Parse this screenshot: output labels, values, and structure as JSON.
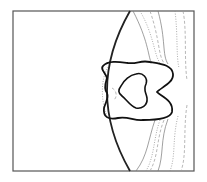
{
  "figure": {
    "type": "contour-plot",
    "frame": {
      "x": 13,
      "y": 11,
      "width": 181,
      "height": 160,
      "stroke": "#555555"
    },
    "colors": {
      "frame": "#555555",
      "shock": "#222222",
      "body_outer": "#111111",
      "body_inner": "#111111",
      "thin_contour": "#777777",
      "dotted_contour": "#888888",
      "dashed_contour": "#999999"
    },
    "shock_front": "M 130 11 Q 84 91 130 171",
    "body_outer": "M 103 66 C 108 60 120 62 128 63 C 138 64 140 60 150 62 C 162 64 172 65 173 74 C 174 83 160 88 157 92 C 160 96 174 100 172 112 C 170 120 150 120 143 120 C 134 121 128 116 118 118 C 108 120 103 117 104 108 C 106 101 109 98 107 93 C 103 88 106 82 107 78 C 105 72 100 69 103 66 Z",
    "body_inner": "M 121 86 C 124 80 130 75 136 74 C 143 72 148 78 146 84 C 143 90 146 92 147 98 C 148 106 141 109 136 108 C 130 106 126 99 122 96 C 118 93 118 90 121 86 Z",
    "thin_contours": [
      "M 133 11 C 148 40 148 55 151 62",
      "M 155 120 C 148 140 148 155 136 171",
      "M 158 11 C 166 40 162 55 168 64",
      "M 168 119 C 160 140 164 155 158 171"
    ],
    "dotted_contours": [
      "M 140 11 C 154 35 154 55 160 63",
      "M 160 120 C 153 140 155 155 146 171",
      "M 108 67 C 100 80 101 104 108 118",
      "M 175 11 C 178 35 176 55 179 68",
      "M 178 116 C 172 140 176 155 170 171"
    ],
    "dashed_contours": [
      "M 150 11 C 160 40 158 55 164 63",
      "M 164 120 C 156 140 159 155 150 171",
      "M 183 11 C 187 30 184 60 187 80",
      "M 187 105 C 183 130 187 155 181 171",
      "M 112 88 C 116 90 118 96 114 100"
    ]
  }
}
